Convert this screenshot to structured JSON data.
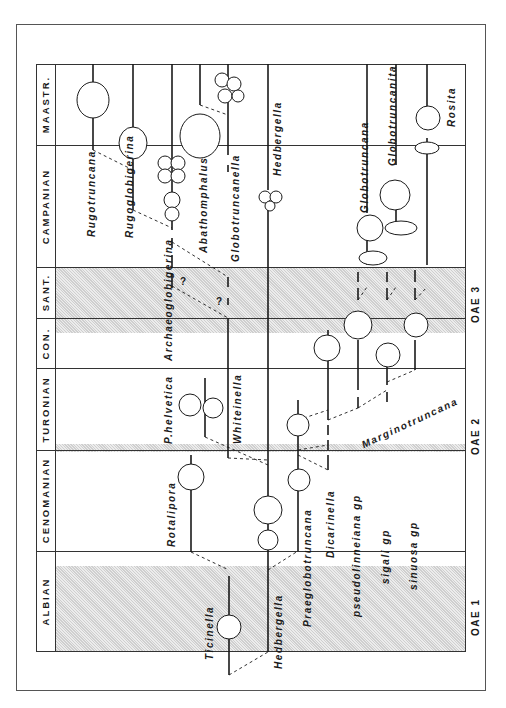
{
  "figure": {
    "type": "biostratigraphic range chart (rotated 90°)",
    "stages": [
      {
        "label": "MAASTR.",
        "top": 64,
        "bottom": 145
      },
      {
        "label": "CAMPANIAN",
        "top": 145,
        "bottom": 267
      },
      {
        "label": "SANT.",
        "top": 267,
        "bottom": 318
      },
      {
        "label": "CON.",
        "top": 318,
        "bottom": 368
      },
      {
        "label": "TURONIAN",
        "top": 368,
        "bottom": 450
      },
      {
        "label": "CENOMANIAN",
        "top": 450,
        "bottom": 551
      },
      {
        "label": "ALBIAN",
        "top": 551,
        "bottom": 652
      }
    ],
    "events": [
      {
        "label": "OAE 3",
        "y": 300
      },
      {
        "label": "OAE 2",
        "y": 430
      },
      {
        "label": "OAE 1",
        "y": 610
      }
    ],
    "taxa": [
      {
        "label": "Rugotruncana",
        "x": 86,
        "y": 160
      },
      {
        "label": "Rugoglobigerina",
        "x": 124,
        "y": 232
      },
      {
        "label": "Archaeoglobigerina",
        "x": 164,
        "y": 362
      },
      {
        "label": "Abathomphalus",
        "x": 194,
        "y": 248
      },
      {
        "label": "Globotruncanella",
        "x": 222,
        "y": 260
      },
      {
        "label": "Hedbergella",
        "x": 276,
        "y": 168
      },
      {
        "label": "Globotruncana",
        "x": 372,
        "y": 207
      },
      {
        "label": "Globotruncanita",
        "x": 398,
        "y": 165
      },
      {
        "label": "Rosita",
        "x": 448,
        "y": 124
      },
      {
        "label": "P.helvetica",
        "x": 165,
        "y": 444
      },
      {
        "label": "Whiteinella",
        "x": 238,
        "y": 444
      },
      {
        "label": "Rotalipora",
        "x": 168,
        "y": 545
      },
      {
        "label": "Ticinella",
        "x": 206,
        "y": 660
      },
      {
        "label": "Hedbergella",
        "x": 276,
        "y": 669
      },
      {
        "label": "Praeglobotruncana",
        "x": 305,
        "y": 625
      },
      {
        "label": "Dicarinella",
        "x": 328,
        "y": 557
      },
      {
        "label": "pseudolinneiana gp",
        "x": 354,
        "y": 615
      },
      {
        "label": "sigali gp",
        "x": 380,
        "y": 583
      },
      {
        "label": "sinuosa gp",
        "x": 406,
        "y": 589
      }
    ],
    "marginotruncana_label": "Marginotruncana",
    "question_marks": [
      "?",
      "?"
    ]
  },
  "colors": {
    "line": "#1a1a1a",
    "shade": "#d8d8d8",
    "frame": "#333333"
  }
}
